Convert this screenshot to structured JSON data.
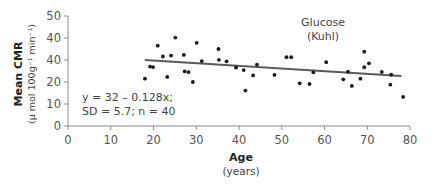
{
  "chart_data": {
    "type": "scatter",
    "title": "Glucose (Kuhl)",
    "series_label_line1": "Glucose",
    "series_label_line2": "(Kuhl)",
    "xlabel": "Age",
    "xlabel_sub": "(years)",
    "ylabel": "Mean CMR",
    "ylabel_sub": "(µ mol 100g⁻¹ min⁻¹)",
    "xlim": [
      0,
      80
    ],
    "ylim": [
      0,
      50
    ],
    "x_ticks": [
      0,
      10,
      20,
      30,
      40,
      50,
      60,
      70,
      80
    ],
    "x_tick_labels": [
      "0",
      "10",
      "20",
      "30",
      "40",
      "50",
      "60",
      "70",
      "80"
    ],
    "y_ticks": [
      0,
      10,
      20,
      30,
      40,
      50
    ],
    "y_tick_labels": [
      "0",
      "10",
      "20",
      "40",
      "40",
      "50"
    ],
    "grid": false,
    "legend": "none",
    "annotation_line1": "y = 32 – 0.128x;",
    "annotation_line2": "SD = 5.7; n = 40",
    "regression": {
      "intercept": 32,
      "slope": -0.128,
      "x_range": [
        18,
        78
      ],
      "drawn_y_start": 30,
      "drawn_y_end": 22.7,
      "sd": 5.7,
      "n": 40
    },
    "points": [
      {
        "x": 18.0,
        "y": 21.5
      },
      {
        "x": 19.2,
        "y": 27.0
      },
      {
        "x": 19.9,
        "y": 26.8
      },
      {
        "x": 21.0,
        "y": 36.5
      },
      {
        "x": 22.2,
        "y": 31.6
      },
      {
        "x": 23.2,
        "y": 22.3
      },
      {
        "x": 24.1,
        "y": 32.0
      },
      {
        "x": 25.1,
        "y": 40.2
      },
      {
        "x": 27.1,
        "y": 32.3
      },
      {
        "x": 27.3,
        "y": 24.8
      },
      {
        "x": 28.2,
        "y": 24.5
      },
      {
        "x": 29.2,
        "y": 20.0
      },
      {
        "x": 30.1,
        "y": 37.8
      },
      {
        "x": 31.3,
        "y": 29.5
      },
      {
        "x": 35.2,
        "y": 35.0
      },
      {
        "x": 35.3,
        "y": 30.1
      },
      {
        "x": 37.1,
        "y": 29.4
      },
      {
        "x": 39.3,
        "y": 26.6
      },
      {
        "x": 41.1,
        "y": 25.4
      },
      {
        "x": 41.5,
        "y": 16.1
      },
      {
        "x": 43.3,
        "y": 23.0
      },
      {
        "x": 44.2,
        "y": 27.9
      },
      {
        "x": 48.3,
        "y": 23.2
      },
      {
        "x": 51.1,
        "y": 31.3
      },
      {
        "x": 52.2,
        "y": 31.3
      },
      {
        "x": 54.2,
        "y": 19.4
      },
      {
        "x": 56.5,
        "y": 19.1
      },
      {
        "x": 57.4,
        "y": 24.4
      },
      {
        "x": 60.4,
        "y": 29.0
      },
      {
        "x": 64.4,
        "y": 21.2
      },
      {
        "x": 65.5,
        "y": 24.7
      },
      {
        "x": 66.4,
        "y": 18.2
      },
      {
        "x": 68.4,
        "y": 21.5
      },
      {
        "x": 69.3,
        "y": 33.8
      },
      {
        "x": 69.3,
        "y": 26.7
      },
      {
        "x": 70.4,
        "y": 28.5
      },
      {
        "x": 73.4,
        "y": 24.6
      },
      {
        "x": 75.4,
        "y": 18.8
      },
      {
        "x": 75.6,
        "y": 23.3
      },
      {
        "x": 78.4,
        "y": 13.2
      }
    ]
  },
  "colors": {
    "axis": "#8a8a8a",
    "points": "#1a1a1a",
    "regression_line": "#5a5a5a",
    "text": "#444444"
  },
  "plot_area": {
    "x0_px": 68,
    "x1_px": 410,
    "y0_px": 126,
    "y1_px": 16
  }
}
